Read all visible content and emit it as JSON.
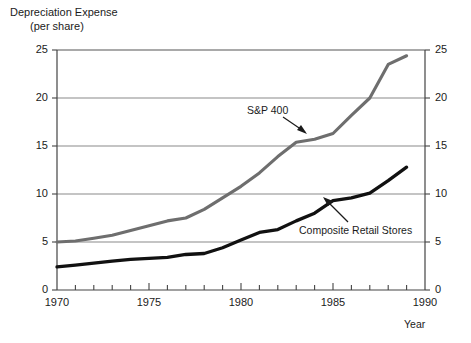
{
  "title": {
    "line1": "Depreciation Expense",
    "line2": "(per share)"
  },
  "axis": {
    "x_title": "Year",
    "y_ticks": [
      "0",
      "5",
      "10",
      "15",
      "20",
      "25"
    ],
    "y_ticks_right": [
      "0",
      "5",
      "10",
      "15",
      "20",
      "25"
    ],
    "x_ticks": [
      "1970",
      "1975",
      "1980",
      "1985",
      "1990"
    ]
  },
  "annotations": {
    "sp400": "S&P 400",
    "composite": "Composite Retail Stores"
  },
  "colors": {
    "sp400_line": "#6e6e6e",
    "composite_line": "#111111",
    "gridline": "#8a8a8a",
    "axis": "#333333",
    "text": "#1b1b1b",
    "background": "#ffffff"
  },
  "chart_data": {
    "type": "line",
    "title": "Depreciation Expense (per share)",
    "xlabel": "Year",
    "ylabel": "",
    "xlim": [
      1970,
      1990
    ],
    "ylim": [
      0,
      25
    ],
    "grid": true,
    "gridlines_y": [
      5,
      10,
      15,
      20,
      25
    ],
    "x_tick_labels": [
      1970,
      1975,
      1980,
      1985,
      1990
    ],
    "x_minor_ticks_every": 1,
    "y_tick_values": [
      0,
      5,
      10,
      15,
      20,
      25
    ],
    "dual_y_axis": true,
    "legend": "inline-annotations",
    "series": [
      {
        "name": "S&P 400",
        "color": "#6e6e6e",
        "x": [
          1970,
          1971,
          1972,
          1973,
          1974,
          1975,
          1976,
          1977,
          1978,
          1979,
          1980,
          1981,
          1982,
          1983,
          1984,
          1985,
          1986,
          1987,
          1988,
          1989
        ],
        "values": [
          5.0,
          5.1,
          5.4,
          5.7,
          6.2,
          6.7,
          7.2,
          7.5,
          8.4,
          9.6,
          10.8,
          12.2,
          13.9,
          15.4,
          15.7,
          16.3,
          18.2,
          20.0,
          23.5,
          24.4
        ]
      },
      {
        "name": "Composite Retail Stores",
        "color": "#111111",
        "x": [
          1970,
          1971,
          1972,
          1973,
          1974,
          1975,
          1976,
          1977,
          1978,
          1979,
          1980,
          1981,
          1982,
          1983,
          1984,
          1985,
          1986,
          1987,
          1988,
          1989
        ],
        "values": [
          2.4,
          2.6,
          2.8,
          3.0,
          3.2,
          3.3,
          3.4,
          3.7,
          3.8,
          4.4,
          5.2,
          6.0,
          6.3,
          7.2,
          8.0,
          9.3,
          9.6,
          10.1,
          11.4,
          12.8
        ]
      }
    ]
  }
}
